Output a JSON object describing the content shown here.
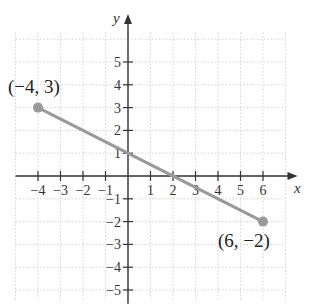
{
  "chart_data": {
    "type": "line",
    "title": "",
    "xlabel": "x",
    "ylabel": "y",
    "xlim": [
      -5,
      7
    ],
    "ylim": [
      -5.5,
      6
    ],
    "grid": true,
    "x_ticks": [
      -4,
      -3,
      -2,
      -1,
      1,
      2,
      3,
      4,
      5,
      6
    ],
    "y_ticks": [
      -5,
      -4,
      -3,
      -2,
      -1,
      1,
      2,
      3,
      4,
      5
    ],
    "x_tick_labels": [
      "−4",
      "−3",
      "−2",
      "−1",
      "1",
      "2",
      "3",
      "4",
      "5",
      "6"
    ],
    "y_tick_labels": [
      "−5",
      "−4",
      "−3",
      "−2",
      "−1",
      "1",
      "2",
      "3",
      "4",
      "5"
    ],
    "series": [
      {
        "name": "segment",
        "points": [
          {
            "x": -4,
            "y": 3,
            "label": "(−4, 3)"
          },
          {
            "x": 6,
            "y": -2,
            "label": "(6, −2)"
          }
        ]
      }
    ],
    "line_color": "#9a9a9a",
    "point_color": "#9a9a9a",
    "axis_color": "#333333",
    "grid_color": "#c8c8c8"
  },
  "labels": {
    "x_axis": "x",
    "y_axis": "y",
    "point_a": "(−4, 3)",
    "point_b": "(6, −2)"
  }
}
